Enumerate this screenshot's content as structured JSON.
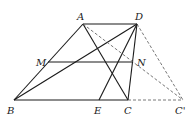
{
  "diagram": {
    "type": "geometry-trapezoid",
    "points": {
      "A": {
        "label": "A",
        "x": 83,
        "y": 24
      },
      "D": {
        "label": "D",
        "x": 137,
        "y": 24
      },
      "M": {
        "label": "M",
        "x": 48,
        "y": 62
      },
      "N": {
        "label": "N",
        "x": 133,
        "y": 62
      },
      "B": {
        "label": "B",
        "x": 14,
        "y": 100
      },
      "E": {
        "label": "E",
        "x": 99,
        "y": 100
      },
      "C": {
        "label": "C",
        "x": 128,
        "y": 100
      },
      "Cp": {
        "label": "C'",
        "x": 183,
        "y": 100
      }
    },
    "solid_segments": [
      "AD",
      "AB",
      "BC",
      "DC",
      "MN",
      "BD",
      "AC",
      "DE"
    ],
    "dashed_segments": [
      "AC'",
      "DC'",
      "CC'"
    ],
    "colors": {
      "line": "#1a1a1a",
      "dashed": "#555555",
      "text": "#222222"
    }
  }
}
